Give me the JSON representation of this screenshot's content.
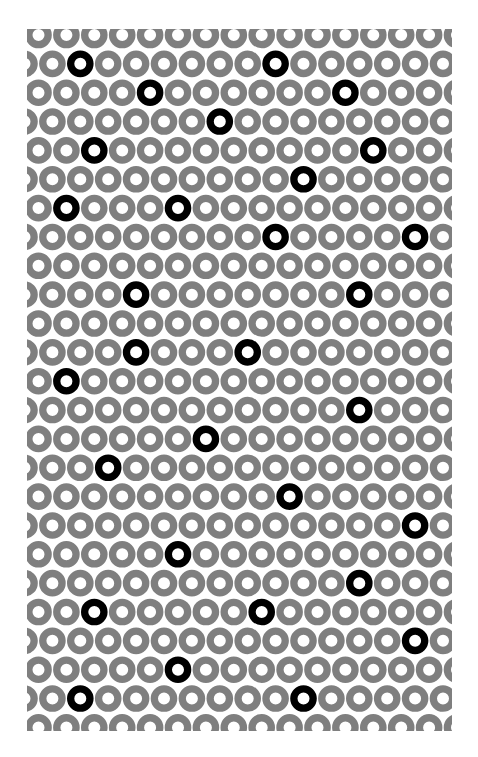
{
  "pattern": {
    "title": "",
    "clip": {
      "x": 27,
      "y": 29,
      "width": 425,
      "height": 702
    },
    "grid": {
      "rows": 25,
      "row_y0": 35,
      "row_pitch": 28.85,
      "col_pitch": 27.9,
      "even_row_x0": 38.5,
      "odd_row_x0": 24.5,
      "cols_per_row": 17
    },
    "ring": {
      "outer_radius": 13.3,
      "inner_radius": 6.0
    },
    "colors": {
      "background": "#ffffff",
      "ring": "#7f7f7f",
      "highlight_ring": "#000000",
      "hole": "#ffffff"
    },
    "highlighted": [
      [
        1,
        2
      ],
      [
        1,
        9
      ],
      [
        2,
        4
      ],
      [
        2,
        11
      ],
      [
        3,
        7
      ],
      [
        4,
        2
      ],
      [
        4,
        12
      ],
      [
        5,
        10
      ],
      [
        6,
        1
      ],
      [
        6,
        5
      ],
      [
        7,
        9
      ],
      [
        7,
        14
      ],
      [
        9,
        4
      ],
      [
        9,
        12
      ],
      [
        11,
        4
      ],
      [
        11,
        8
      ],
      [
        12,
        1
      ],
      [
        13,
        12
      ],
      [
        14,
        6
      ],
      [
        15,
        3
      ],
      [
        16,
        9
      ],
      [
        17,
        14
      ],
      [
        18,
        5
      ],
      [
        19,
        12
      ],
      [
        20,
        2
      ],
      [
        20,
        8
      ],
      [
        21,
        14
      ],
      [
        22,
        5
      ],
      [
        23,
        2
      ],
      [
        23,
        10
      ]
    ]
  }
}
